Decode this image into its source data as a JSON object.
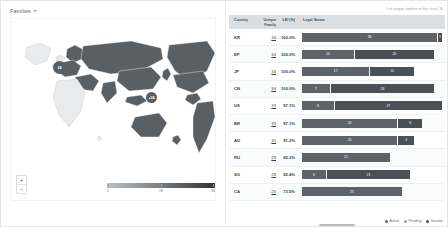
{
  "panel": {
    "title": "Families",
    "caret_icon": "chevron-down-icon"
  },
  "map": {
    "cluster_labels": [
      "34",
      "+34"
    ],
    "zoom_in_label": "+",
    "zoom_out_label": "−",
    "colorbar": {
      "ticks": [
        "1",
        "18",
        "34"
      ],
      "gradient_from": "#b9c0c6",
      "gradient_to": "#2f3438"
    }
  },
  "chart_note": "# of unique families in this chart: 34",
  "table": {
    "headers": {
      "country": "Country",
      "count": "Unique Family",
      "pct": "LEI (%)",
      "bar": "Legal Status"
    },
    "rows": [
      {
        "country": "KR",
        "count": "34",
        "pct": "100.0%",
        "segments": [
          {
            "status": "Active",
            "value": 34,
            "label": "34"
          },
          {
            "status": "Pending",
            "value": 0,
            "label": ""
          },
          {
            "status": "Inactive",
            "value": 1,
            "label": "1"
          }
        ]
      },
      {
        "country": "EP",
        "count": "34",
        "pct": "100.0%",
        "segments": [
          {
            "status": "Active",
            "value": 13,
            "label": "13"
          },
          {
            "status": "Pending",
            "value": 0,
            "label": ""
          },
          {
            "status": "Inactive",
            "value": 20,
            "label": "20"
          }
        ]
      },
      {
        "country": "JP",
        "count": "34",
        "pct": "100.0%",
        "segments": [
          {
            "status": "Active",
            "value": 17,
            "label": "17"
          },
          {
            "status": "Pending",
            "value": 0,
            "label": ""
          },
          {
            "status": "Inactive",
            "value": 11,
            "label": "11"
          }
        ]
      },
      {
        "country": "CN",
        "count": "34",
        "pct": "100.0%",
        "segments": [
          {
            "status": "Active",
            "value": 7,
            "label": "7"
          },
          {
            "status": "Pending",
            "value": 0,
            "label": ""
          },
          {
            "status": "Inactive",
            "value": 26,
            "label": "26"
          }
        ]
      },
      {
        "country": "US",
        "count": "33",
        "pct": "97.1%",
        "segments": [
          {
            "status": "Active",
            "value": 8,
            "label": "8"
          },
          {
            "status": "Pending",
            "value": 0,
            "label": ""
          },
          {
            "status": "Inactive",
            "value": 27,
            "label": "27"
          }
        ]
      },
      {
        "country": "BR",
        "count": "33",
        "pct": "97.1%",
        "segments": [
          {
            "status": "Active",
            "value": 24,
            "label": "24"
          },
          {
            "status": "Pending",
            "value": 0,
            "label": ""
          },
          {
            "status": "Inactive",
            "value": 6,
            "label": "6"
          }
        ]
      },
      {
        "country": "AU",
        "count": "31",
        "pct": "91.2%",
        "segments": [
          {
            "status": "Active",
            "value": 24,
            "label": "24"
          },
          {
            "status": "Pending",
            "value": 0,
            "label": ""
          },
          {
            "status": "Inactive",
            "value": 4,
            "label": "4"
          }
        ]
      },
      {
        "country": "RU",
        "count": "29",
        "pct": "85.3%",
        "segments": [
          {
            "status": "Active",
            "value": 22,
            "label": "22"
          },
          {
            "status": "Pending",
            "value": 0,
            "label": ""
          },
          {
            "status": "Inactive",
            "value": 0,
            "label": ""
          }
        ]
      },
      {
        "country": "SG",
        "count": "28",
        "pct": "82.4%",
        "segments": [
          {
            "status": "Active",
            "value": 6,
            "label": "6"
          },
          {
            "status": "Pending",
            "value": 0,
            "label": ""
          },
          {
            "status": "Inactive",
            "value": 21,
            "label": "21"
          }
        ]
      },
      {
        "country": "CA",
        "count": "25",
        "pct": "73.5%",
        "segments": [
          {
            "status": "Active",
            "value": 25,
            "label": "25"
          },
          {
            "status": "Pending",
            "value": 0,
            "label": ""
          },
          {
            "status": "Inactive",
            "value": 0,
            "label": ""
          }
        ]
      }
    ]
  },
  "legend": [
    {
      "label": "Active",
      "color": "#5f6368"
    },
    {
      "label": "Pending",
      "color": "#9aa0a6"
    },
    {
      "label": "Inactive",
      "color": "#4b5054"
    }
  ],
  "chart_data": {
    "type": "bar",
    "orientation": "horizontal",
    "stacked": true,
    "categories": [
      "KR",
      "EP",
      "JP",
      "CN",
      "US",
      "BR",
      "AU",
      "RU",
      "SG",
      "CA"
    ],
    "series": [
      {
        "name": "Active",
        "values": [
          34,
          13,
          17,
          7,
          8,
          24,
          24,
          22,
          6,
          25
        ]
      },
      {
        "name": "Pending",
        "values": [
          0,
          0,
          0,
          0,
          0,
          0,
          0,
          0,
          0,
          0
        ]
      },
      {
        "name": "Inactive",
        "values": [
          1,
          20,
          11,
          26,
          27,
          6,
          4,
          0,
          21,
          0
        ]
      }
    ],
    "secondary_columns": {
      "Unique Family": [
        34,
        34,
        34,
        34,
        33,
        33,
        31,
        29,
        28,
        25
      ],
      "LEI (%)": [
        100.0,
        100.0,
        100.0,
        100.0,
        97.1,
        97.1,
        91.2,
        85.3,
        82.4,
        73.5
      ]
    },
    "xlabel": "",
    "ylabel": "Country",
    "legend_position": "bottom-right",
    "grid": false
  },
  "map_data": {
    "type": "choropleth",
    "value_range": [
      1,
      34
    ],
    "colorbar_ticks": [
      1,
      18,
      34
    ]
  }
}
